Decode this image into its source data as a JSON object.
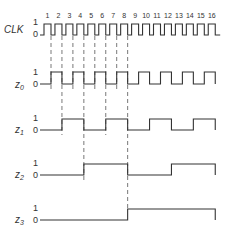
{
  "diagram": {
    "type": "timing-diagram",
    "clock": {
      "label": "CLK",
      "pulse_numbers": [
        "1",
        "2",
        "3",
        "4",
        "5",
        "6",
        "7",
        "8",
        "9",
        "10",
        "11",
        "12",
        "13",
        "14",
        "15",
        "16"
      ]
    },
    "signals": [
      {
        "label": "z",
        "subscript": "0",
        "high": "1",
        "low": "0"
      },
      {
        "label": "z",
        "subscript": "1",
        "high": "1",
        "low": "0"
      },
      {
        "label": "z",
        "subscript": "2",
        "high": "1",
        "low": "0"
      },
      {
        "label": "z",
        "subscript": "3",
        "high": "1",
        "low": "0"
      }
    ],
    "clock_levels": {
      "high": "1",
      "low": "0"
    },
    "colors": {
      "line": "#333333",
      "background": "#ffffff"
    }
  }
}
